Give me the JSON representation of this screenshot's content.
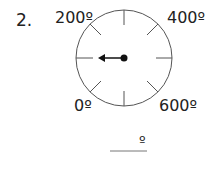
{
  "question": {
    "number": "2.",
    "dial": {
      "labels": {
        "top_left": "200º",
        "top_right": "400º",
        "bottom_left": "0º",
        "bottom_right": "600º"
      },
      "tick_count": 8,
      "pointer_direction": "left"
    },
    "answer": {
      "value": "",
      "unit": "º"
    }
  }
}
